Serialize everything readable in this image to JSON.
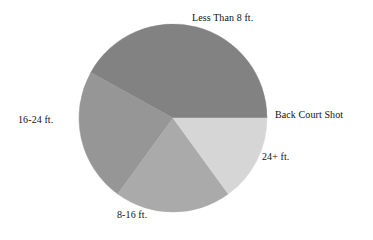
{
  "chart_data": {
    "type": "pie",
    "title": "",
    "subtitle": "",
    "xlabel": "",
    "ylabel": "",
    "legend_position": "none",
    "grid": false,
    "labels_position": "outside",
    "categories": [
      "Less Than 8 ft.",
      "Back Court Shot",
      "24+ ft.",
      "8-16 ft.",
      "16-24 ft."
    ],
    "values": [
      42,
      0,
      15,
      20,
      23
    ],
    "units": "percent",
    "colors": [
      "#828282",
      "#d6d6d6",
      "#d6d6d6",
      "#aaaaaa",
      "#969696"
    ],
    "slices": [
      {
        "label": "Less Than 8 ft.",
        "value": 42,
        "color": "#828282",
        "start_angle": 0,
        "end_angle": 151
      },
      {
        "label": "16-24 ft.",
        "value": 23,
        "color": "#969696",
        "start_angle": 151,
        "end_angle": 234
      },
      {
        "label": "8-16 ft.",
        "value": 20,
        "color": "#aaaaaa",
        "start_angle": 234,
        "end_angle": 306
      },
      {
        "label": "24+ ft.",
        "value": 15,
        "color": "#d6d6d6",
        "start_angle": 306,
        "end_angle": 360
      },
      {
        "label": "Back Court Shot",
        "value": 0,
        "color": "#d6d6d6",
        "start_angle": 360,
        "end_angle": 360
      }
    ]
  },
  "labels": {
    "less_than_8": "Less Than 8 ft.",
    "back_court_shot": "Back Court Shot",
    "twentyfour_plus": "24+ ft.",
    "eight_to_sixteen": "8-16 ft.",
    "sixteen_to_twentyfour": "16-24 ft."
  },
  "geometry": {
    "center_x": 173,
    "center_y": 118,
    "radius": 94
  },
  "colors": {
    "background": "#ffffff",
    "text": "#111111",
    "slice_darkest": "#828282",
    "slice_medium": "#969696",
    "slice_light_medium": "#aaaaaa",
    "slice_lightest": "#d6d6d6"
  }
}
